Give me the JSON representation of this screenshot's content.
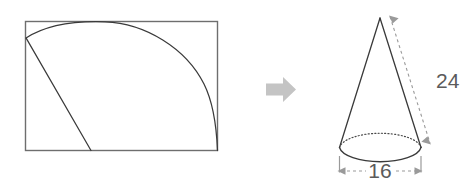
{
  "diagram": {
    "colors": {
      "outline": "#3a3a3a",
      "rectangle_stroke": "#6e6e6e",
      "arc_stroke": "#3a3a3a",
      "dimension_line": "#9a9a9a",
      "arrow_fill": "#c4c4c4",
      "label_text": "#5b5b5b",
      "background": "#ffffff"
    },
    "left_figure": {
      "name": "sector-in-rectangle",
      "shapes": [
        {
          "type": "rectangle",
          "name": "bounding-rectangle"
        },
        {
          "type": "arc",
          "name": "sector-arc"
        },
        {
          "type": "line",
          "name": "sector-radius-line"
        }
      ]
    },
    "transform_arrow": {
      "name": "transform-arrow",
      "direction": "right"
    },
    "right_figure": {
      "name": "cone",
      "shapes": [
        {
          "type": "triangle",
          "name": "cone-body"
        },
        {
          "type": "ellipse",
          "name": "cone-base-ellipse"
        }
      ],
      "dimensions": [
        {
          "name": "slant-height-dimension",
          "label": "24",
          "orientation": "slant"
        },
        {
          "name": "base-diameter-dimension",
          "label": "16",
          "orientation": "horizontal"
        }
      ]
    }
  },
  "labels": {
    "slant_height": "24",
    "base_diameter": "16"
  }
}
